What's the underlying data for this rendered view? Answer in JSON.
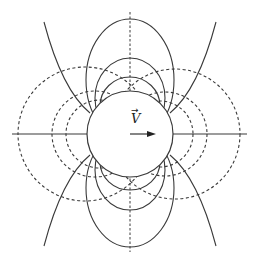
{
  "figure": {
    "velocity_label": "V",
    "velocity_vector_arrow": "→",
    "colors": {
      "stroke": "#3a3a3a",
      "background": "#ffffff"
    },
    "cylinder": {
      "cx": 130,
      "cy": 134,
      "r": 43
    },
    "horizontal_axis": {
      "x1": 12,
      "x2": 247,
      "y": 134
    },
    "vertical_axis": {
      "x": 130,
      "y1": 12,
      "y2": 252
    }
  }
}
